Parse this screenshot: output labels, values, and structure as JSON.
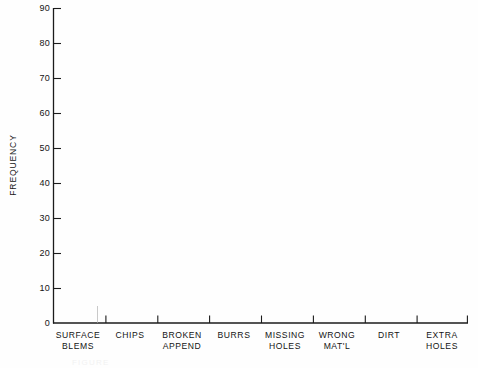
{
  "chart_data": {
    "type": "bar",
    "title": "",
    "xlabel": "",
    "ylabel": "FREQUENCY",
    "categories": [
      "SURFACE\nBLEMS",
      "CHIPS",
      "BROKEN\nAPPEND",
      "BURRS",
      "MISSING\nHOLES",
      "WRONG\nMAT'L",
      "DIRT",
      "EXTRA\nHOLES"
    ],
    "values": [
      0,
      0,
      0,
      0,
      0,
      0,
      0,
      0
    ],
    "ylim": [
      0,
      90
    ],
    "yticks": [
      0,
      10,
      20,
      30,
      40,
      50,
      60,
      70,
      80,
      90
    ],
    "ytick_labels": [
      "0",
      "10",
      "20",
      "30",
      "40",
      "50",
      "60",
      "70",
      "80",
      "90"
    ],
    "grid": false,
    "legend": false,
    "legend_position": "none",
    "note": "Empty frequency / Pareto chart template: axes and defect-category labels drawn, no bars plotted."
  },
  "axes": {
    "y_axis_label": "FREQUENCY",
    "y_tick_labels": [
      "90",
      "80",
      "70",
      "60",
      "50",
      "40",
      "30",
      "20",
      "10",
      "0"
    ],
    "x_tick_labels": [
      "SURFACE\nBLEMS",
      "CHIPS",
      "BROKEN\nAPPEND",
      "BURRS",
      "MISSING\nHOLES",
      "WRONG\nMAT'L",
      "DIRT",
      "EXTRA\nHOLES"
    ]
  },
  "caption": {
    "remnant_text": "FIGURE"
  },
  "colors": {
    "background": "#fefefe",
    "axis": "#1b1b1b",
    "text": "#141414"
  }
}
